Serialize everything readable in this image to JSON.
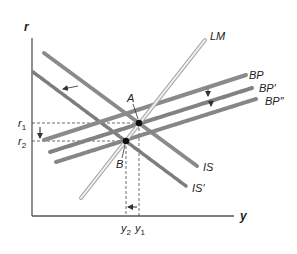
{
  "diagram": {
    "type": "IS-LM-BP macroeconomic diagram",
    "axes": {
      "y_label": "r",
      "x_label": "y"
    },
    "curves": [
      {
        "id": "LM",
        "label": "LM",
        "style": "hollow-light"
      },
      {
        "id": "BP",
        "label": "BP",
        "style": "solid"
      },
      {
        "id": "BP1",
        "label": "BP′",
        "style": "textured"
      },
      {
        "id": "BP2",
        "label": "BP″",
        "style": "beaded"
      },
      {
        "id": "IS",
        "label": "IS",
        "style": "solid"
      },
      {
        "id": "IS1",
        "label": "IS′",
        "style": "beaded"
      }
    ],
    "points": [
      {
        "id": "A",
        "label": "A"
      },
      {
        "id": "B",
        "label": "B"
      }
    ],
    "ticks": {
      "r1": "r",
      "r1_sub": "1",
      "r2": "r",
      "r2_sub": "2",
      "y1": "y",
      "y1_sub": "1",
      "y2": "y",
      "y2_sub": "2"
    },
    "arrows": [
      "IS shifts left to IS′",
      "BP shifts down to BP′ then BP″",
      "r falls from r1 to r2",
      "y falls from y1 to y2"
    ]
  }
}
